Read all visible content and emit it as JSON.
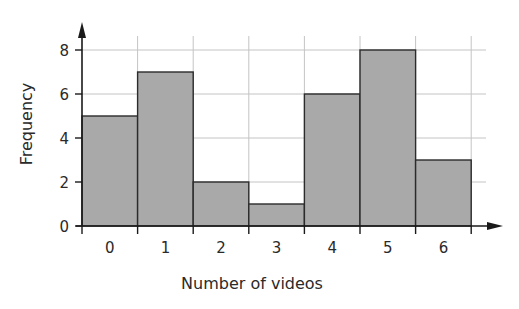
{
  "chart_data": {
    "type": "bar",
    "subtype": "histogram",
    "title": "",
    "xlabel": "Number of videos",
    "ylabel": "Frequency",
    "categories": [
      "0",
      "1",
      "2",
      "3",
      "4",
      "5",
      "6"
    ],
    "values": [
      5,
      7,
      2,
      1,
      6,
      8,
      3
    ],
    "yticks": [
      "0",
      "2",
      "4",
      "6",
      "8"
    ],
    "ylim": [
      0,
      8
    ],
    "grid": true,
    "legend": null,
    "colors": {
      "bar_fill": "#a9a9a9",
      "bar_stroke": "#2b2b2b",
      "grid": "#c4c4c4",
      "axis": "#1a1a1a",
      "text": "#2a2a2a"
    }
  }
}
